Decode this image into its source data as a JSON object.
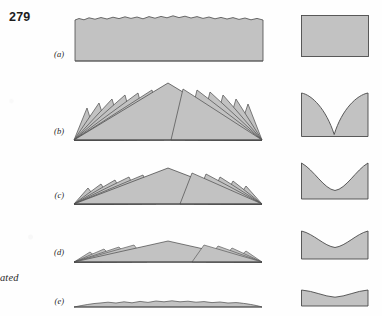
{
  "page": {
    "number": "279",
    "margin_note": "lated",
    "background_color": "#fefefe",
    "fill_color": "#c2c2c2",
    "outline_color": "#4a4a4a",
    "text_color": "#1d1d1d"
  },
  "figure": {
    "caption_label_style": "italic-parenthetical",
    "column_count": 2,
    "left_column_name": "landscape-profile",
    "right_column_name": "cross-section",
    "rows": [
      {
        "label": "(a)",
        "stage": "initial-surface",
        "left_description": "flat plateau block with slightly irregular top edge",
        "right_description": "plain rectangle cross-section, flat top",
        "relief_height": 40,
        "surface_roughness": "low"
      },
      {
        "label": "(b)",
        "stage": "maximum-dissection",
        "left_description": "sharp overlapping triangular peaks with tall central peak",
        "right_description": "deep V-shaped cusp valley cut through block",
        "relief_height": 48,
        "surface_roughness": "very-high"
      },
      {
        "label": "(c)",
        "stage": "early-reduction",
        "left_description": "lower rounded peaks, reduced amplitude",
        "right_description": "smooth U-shaped concave valley",
        "relief_height": 33,
        "surface_roughness": "high"
      },
      {
        "label": "(d)",
        "stage": "late-reduction",
        "left_description": "low subdued hills on broad gentle swell",
        "right_description": "shallow wide concave depression",
        "relief_height": 21,
        "surface_roughness": "moderate"
      },
      {
        "label": "(e)",
        "stage": "peneplain",
        "left_description": "nearly flat thin lens, minimal relief",
        "right_description": "thin block with very subtle concave top",
        "relief_height": 10,
        "surface_roughness": "very-low"
      }
    ]
  }
}
